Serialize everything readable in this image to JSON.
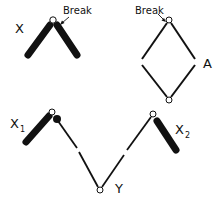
{
  "diagram": {
    "colors": {
      "line": "#111111",
      "background": "#ffffff",
      "node_fill": "#ffffff"
    },
    "panel_x": {
      "label": "X",
      "break_label": "Break"
    },
    "panel_a": {
      "label": "A",
      "break_label": "Break"
    },
    "panel_bottom": {
      "label_x1_main": "X",
      "label_x1_sub": "1",
      "label_y": "Y",
      "label_x2_main": "X",
      "label_x2_sub": "2"
    }
  }
}
